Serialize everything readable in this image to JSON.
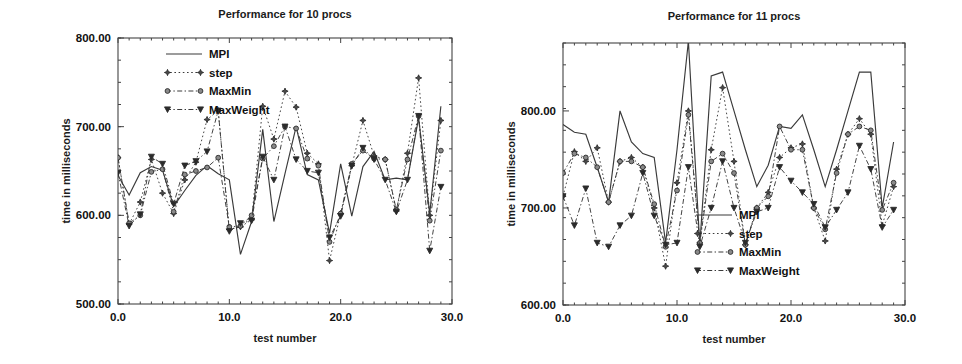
{
  "figures": [
    {
      "id": "left",
      "title": "Performance for 10 procs",
      "xlabel": "test number",
      "ylabel": "time in milliseconds"
    },
    {
      "id": "right",
      "title": "Performance for 11 procs",
      "xlabel": "test number",
      "ylabel": "time in milliseconds"
    }
  ],
  "chart_data": [
    {
      "type": "line",
      "title": "Performance for 10 procs",
      "xlabel": "test number",
      "ylabel": "time in milliseconds",
      "xlim": [
        0,
        30
      ],
      "ylim": [
        500,
        800
      ],
      "xticks": [
        0,
        10,
        20,
        30
      ],
      "xticklabels": [
        "0.0",
        "10.0",
        "20.0",
        "30.0"
      ],
      "yticks": [
        500,
        600,
        700,
        800
      ],
      "yticklabels": [
        "500.00",
        "600.00",
        "700.00",
        "800.00"
      ],
      "grid": false,
      "legend_position": "top-right",
      "legend": [
        "MPI",
        "step",
        "MaxMin",
        "MaxWeight"
      ],
      "x": [
        0,
        1,
        2,
        3,
        4,
        5,
        6,
        7,
        8,
        9,
        10,
        11,
        12,
        13,
        14,
        15,
        16,
        17,
        18,
        19,
        20,
        21,
        22,
        23,
        24,
        25,
        26,
        27,
        28,
        29
      ],
      "series": [
        {
          "name": "MPI",
          "style": "solid",
          "marker": "none",
          "values": [
            645,
            623,
            648,
            655,
            651,
            610,
            628,
            645,
            656,
            647,
            640,
            556,
            593,
            697,
            593,
            647,
            700,
            646,
            640,
            580,
            658,
            599,
            655,
            672,
            640,
            642,
            640,
            710,
            602,
            723
          ]
        },
        {
          "name": "step",
          "style": "dotted",
          "marker": "star",
          "values": [
            665,
            590,
            615,
            663,
            625,
            602,
            640,
            660,
            708,
            718,
            584,
            587,
            595,
            723,
            686,
            740,
            722,
            670,
            658,
            549,
            602,
            656,
            707,
            667,
            663,
            605,
            670,
            755,
            600,
            707
          ]
        },
        {
          "name": "MaxMin",
          "style": "dash-dot",
          "marker": "circle",
          "values": [
            665,
            591,
            600,
            649,
            652,
            604,
            646,
            650,
            654,
            665,
            587,
            588,
            600,
            664,
            678,
            700,
            698,
            664,
            656,
            570,
            602,
            658,
            673,
            664,
            663,
            606,
            663,
            712,
            594,
            673
          ]
        },
        {
          "name": "MaxWeight",
          "style": "dash-dot",
          "marker": "triangle-down",
          "values": [
            648,
            588,
            601,
            666,
            658,
            613,
            656,
            661,
            672,
            718,
            582,
            591,
            594,
            666,
            640,
            700,
            663,
            650,
            648,
            575,
            599,
            656,
            676,
            663,
            640,
            604,
            640,
            712,
            560,
            632
          ]
        }
      ]
    },
    {
      "type": "line",
      "title": "Performance for 11 procs",
      "xlabel": "test number",
      "ylabel": "time in milliseconds",
      "xlim": [
        0,
        30
      ],
      "ylim": [
        600,
        870
      ],
      "xticks": [
        0,
        10,
        20,
        30
      ],
      "xticklabels": [
        "0.0",
        "10.0",
        "20.0",
        "30.0"
      ],
      "yticks": [
        600,
        700,
        800
      ],
      "yticklabels": [
        "600.00",
        "700.00",
        "800.00"
      ],
      "grid": false,
      "legend_position": "bottom-right",
      "legend": [
        "MPI",
        "step",
        "MaxMin",
        "MaxWeight"
      ],
      "x": [
        0,
        1,
        2,
        3,
        4,
        5,
        6,
        7,
        8,
        9,
        10,
        11,
        12,
        13,
        14,
        15,
        16,
        17,
        18,
        19,
        20,
        21,
        22,
        23,
        24,
        25,
        26,
        27,
        28,
        29
      ],
      "series": [
        {
          "name": "MPI",
          "style": "solid",
          "marker": "none",
          "values": [
            786,
            778,
            776,
            742,
            706,
            800,
            768,
            756,
            752,
            664,
            760,
            872,
            662,
            836,
            840,
            800,
            760,
            722,
            744,
            784,
            782,
            796,
            760,
            722,
            760,
            800,
            840,
            840,
            700,
            768
          ]
        },
        {
          "name": "step",
          "style": "dotted",
          "marker": "star",
          "values": [
            712,
            758,
            748,
            762,
            706,
            748,
            752,
            742,
            700,
            640,
            726,
            800,
            664,
            760,
            824,
            748,
            662,
            700,
            716,
            752,
            762,
            766,
            700,
            666,
            740,
            776,
            792,
            776,
            682,
            722
          ]
        },
        {
          "name": "MaxMin",
          "style": "dash-dot",
          "marker": "circle",
          "values": [
            736,
            756,
            752,
            742,
            706,
            748,
            748,
            742,
            704,
            660,
            718,
            796,
            664,
            748,
            756,
            736,
            662,
            700,
            712,
            784,
            760,
            760,
            700,
            678,
            736,
            776,
            784,
            780,
            698,
            726
          ]
        },
        {
          "name": "MaxWeight",
          "style": "dash-dot",
          "marker": "triangle-down",
          "values": [
            712,
            682,
            720,
            664,
            660,
            682,
            692,
            736,
            692,
            662,
            664,
            742,
            660,
            700,
            748,
            700,
            664,
            696,
            700,
            742,
            728,
            716,
            704,
            680,
            698,
            716,
            764,
            740,
            680,
            698
          ]
        }
      ]
    }
  ]
}
